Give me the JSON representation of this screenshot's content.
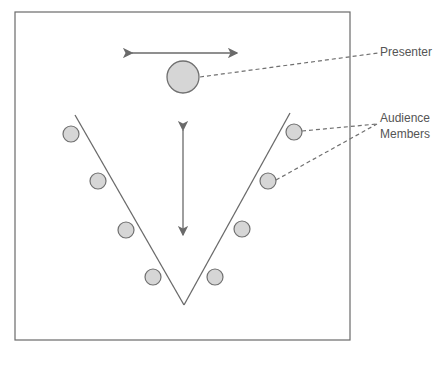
{
  "diagram": {
    "labels": {
      "presenter": "Presenter",
      "audience_line1": "Audience",
      "audience_line2": "Members"
    },
    "colors": {
      "stroke": "#707070",
      "fill": "#d6d6d6",
      "text": "#555555"
    },
    "elements": {
      "frame": "room boundary",
      "presenter_circle": "presenter position",
      "horizontal_arrow": "presenter lateral movement",
      "vertical_arrow": "presenter forward/back movement",
      "v_lines": "V-shaped seating arrangement",
      "audience_circles": 8
    }
  }
}
